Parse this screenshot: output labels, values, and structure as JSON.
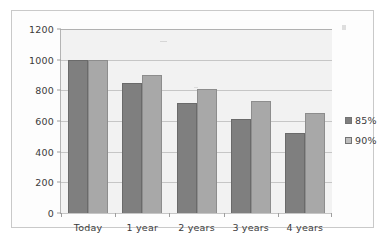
{
  "chart_data": {
    "type": "bar",
    "title": "",
    "subtitle": "",
    "xlabel": "",
    "ylabel": "",
    "categories": [
      "Today",
      "1 year",
      "2 years",
      "3 years",
      "4 years"
    ],
    "series": [
      {
        "name": "85%",
        "color": "#7f7f7f",
        "values": [
          1000,
          850,
          720,
          615,
          520
        ]
      },
      {
        "name": "90%",
        "color": "#a8a8a8",
        "values": [
          1000,
          900,
          810,
          730,
          655
        ]
      }
    ],
    "ylim": [
      0,
      1200
    ],
    "y_ticks": [
      0,
      200,
      400,
      600,
      800,
      1000,
      1200
    ],
    "y_tick_labels": [
      "0",
      "200",
      "400",
      "600",
      "800",
      "1000",
      "1200"
    ],
    "grid": true,
    "grid_axis": "y",
    "legend": {
      "position": "right",
      "entries": [
        "85%",
        "90%"
      ]
    },
    "plot_background": "#f2f2f2",
    "frame_border": "#c9c9c9"
  }
}
